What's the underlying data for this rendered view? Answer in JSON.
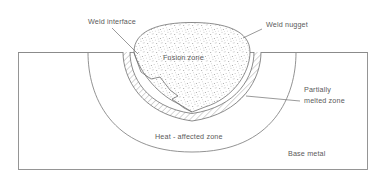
{
  "diagram": {
    "colors": {
      "background": "#ffffff",
      "outline": "#707070",
      "plate_outline": "#8a8a8a",
      "label_text": "#5a5a5a",
      "leader_line": "#6e6e6e",
      "hatch_line": "#6a6a6a",
      "stipple_dot": "#9a9a9a"
    },
    "labels": {
      "weld_interface": "Weld interface",
      "weld_nugget": "Weld nugget",
      "fusion_zone": "Fusion zone",
      "partially_melted_zone_line1": "Partially",
      "partially_melted_zone_line2": "melted zone",
      "heat_affected_zone": "Heat - affected zone",
      "base_metal": "Base metal"
    }
  }
}
